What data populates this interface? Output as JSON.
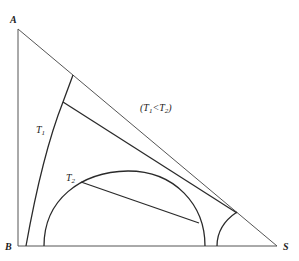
{
  "diagram": {
    "type": "ternary-phase-diagram",
    "vertices": {
      "top": "A",
      "bottom_left": "B",
      "bottom_right": "S"
    },
    "curve_labels": {
      "t1": {
        "base": "T",
        "subscript": "1"
      },
      "t2": {
        "base": "T",
        "subscript": "2"
      }
    },
    "condition": {
      "open": "(",
      "t1_base": "T",
      "t1_sub": "1",
      "relation": "<",
      "t2_base": "T",
      "t2_sub": "2",
      "close": ")"
    },
    "colors": {
      "line": "#2a2a2a",
      "background": "#ffffff"
    }
  }
}
